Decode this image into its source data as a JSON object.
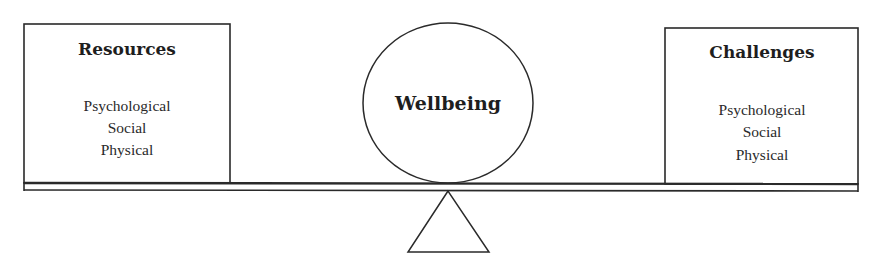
{
  "diagram": {
    "type": "balance-scale",
    "center": {
      "label": "Wellbeing"
    },
    "left_box": {
      "title": "Resources",
      "items": [
        "Psychological",
        "Social",
        "Physical"
      ]
    },
    "right_box": {
      "title": "Challenges",
      "items": [
        "Psychological",
        "Social",
        "Physical"
      ]
    },
    "colors": {
      "line": "#2a2a2a",
      "background": "#ffffff",
      "text": "#1e1e1e"
    }
  }
}
